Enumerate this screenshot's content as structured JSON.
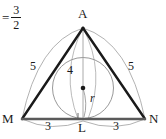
{
  "figure": {
    "equation": {
      "equals_sign": "=",
      "numerator": "3",
      "denominator": "2"
    },
    "vertices": [
      {
        "name": "A",
        "label": "A",
        "x": 83,
        "y": 28
      },
      {
        "name": "M",
        "label": "M",
        "x": 22,
        "y": 119
      },
      {
        "name": "N",
        "label": "N",
        "x": 145,
        "y": 119
      },
      {
        "name": "L",
        "label": "L",
        "x": 83,
        "y": 119
      }
    ],
    "vertex_label_positions": [
      {
        "name": "A",
        "label": "A",
        "left": 78,
        "top": 8
      },
      {
        "name": "M",
        "label": "M",
        "left": 3,
        "top": 113
      },
      {
        "name": "N",
        "label": "N",
        "left": 149,
        "top": 113
      },
      {
        "name": "L",
        "label": "L",
        "left": 79,
        "top": 122
      }
    ],
    "side_labels": [
      {
        "name": "side-ma",
        "label": "5",
        "left": 30,
        "top": 61
      },
      {
        "name": "side-an",
        "label": "5",
        "left": 128,
        "top": 61
      },
      {
        "name": "segment-ml",
        "label": "3",
        "left": 45,
        "top": 120
      },
      {
        "name": "segment-ln",
        "label": "3",
        "left": 113,
        "top": 120
      }
    ],
    "altitude_label": {
      "name": "altitude-al",
      "label": "4",
      "left": 67,
      "top": 65
    },
    "radius_label": {
      "name": "inradius",
      "label": "r",
      "left": 90,
      "top": 92
    },
    "incircle": {
      "cx": 83,
      "cy": 88,
      "r": 30.5
    },
    "incenter_dot": {
      "cx": 83,
      "cy": 88,
      "r": 2.2
    },
    "right_angle_marker": {
      "x": 78,
      "y": 114,
      "size": 6
    },
    "colors": {
      "triangle_stroke": "#1a1a1a",
      "base_stroke": "#5a5a5a",
      "arc_stroke": "#9a9a9a",
      "circle_stroke": "#8d8d8d",
      "altitude_stroke": "#a0a0a0",
      "text": "#1a1a1a",
      "background": "#ffffff"
    }
  }
}
